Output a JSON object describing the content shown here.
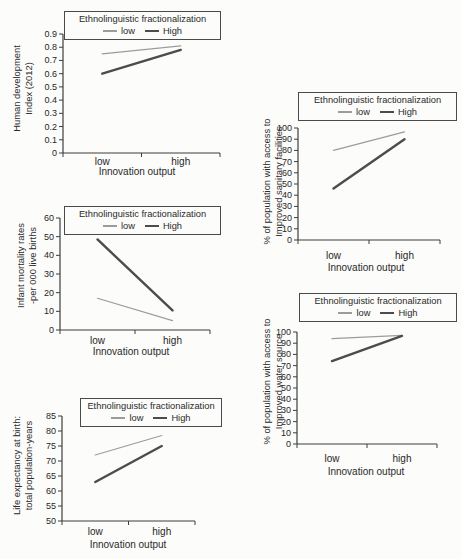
{
  "figure": {
    "legend_title": "Ethnolinguistic fractionalization",
    "legend_entries": [
      "low",
      "High"
    ],
    "xlabel": "Innovation output",
    "x_categories": [
      "low",
      "high"
    ],
    "colors": {
      "background": "#fcfcfa",
      "axis": "#3d3d3d",
      "text": "#262626",
      "legend_border": "#4a4a4a",
      "low_line": "#9c9c9c",
      "high_line": "#4c4c4c"
    }
  },
  "chart_data": [
    {
      "id": "human-development-index",
      "type": "line",
      "title": "",
      "ylabel_lines": [
        "Human development",
        "Index (2012)"
      ],
      "ylabel": "Human development Index (2012)",
      "xlabel": "Innovation output",
      "legend_title": "Ethnolinguistic fractionalization",
      "x": [
        "low",
        "high"
      ],
      "ylim": [
        0,
        0.9
      ],
      "yticks": [
        "0",
        "0.1",
        "0.2",
        "0.3",
        "0.4",
        "0.5",
        "0.6",
        "0.7",
        "0.8",
        "0.9"
      ],
      "series": [
        {
          "name": "low",
          "values": [
            0.75,
            0.81
          ]
        },
        {
          "name": "High",
          "values": [
            0.6,
            0.78
          ]
        }
      ]
    },
    {
      "id": "infant-mortality",
      "type": "line",
      "title": "",
      "ylabel_lines": [
        "Infant mortality rates",
        "-per 000 live births"
      ],
      "ylabel": "Infant mortality rates -per 000 live births",
      "xlabel": "Innovation output",
      "legend_title": "Ethnolinguistic fractionalization",
      "x": [
        "low",
        "high"
      ],
      "ylim": [
        0,
        60
      ],
      "yticks": [
        "0",
        "10",
        "20",
        "30",
        "40",
        "50",
        "60"
      ],
      "series": [
        {
          "name": "low",
          "values": [
            17,
            5
          ]
        },
        {
          "name": "High",
          "values": [
            48.5,
            10.5
          ]
        }
      ]
    },
    {
      "id": "life-expectancy",
      "type": "line",
      "title": "",
      "ylabel_lines": [
        "Life expectancy at birth:",
        "total population-years"
      ],
      "ylabel": "Life expectancy at birth: total population-years",
      "xlabel": "Innovation output",
      "legend_title": "Ethnolinguistic fractionalization",
      "x": [
        "low",
        "high"
      ],
      "ylim": [
        50,
        85
      ],
      "yticks": [
        "50",
        "55",
        "60",
        "65",
        "70",
        "75",
        "80",
        "85"
      ],
      "series": [
        {
          "name": "low",
          "values": [
            72,
            78.5
          ]
        },
        {
          "name": "High",
          "values": [
            63,
            75
          ]
        }
      ]
    },
    {
      "id": "improved-sanitary-facilities",
      "type": "line",
      "title": "",
      "ylabel_lines": [
        "% of population with access to",
        "Improved sanitary facilities"
      ],
      "ylabel": "% of population with access to Improved sanitary facilities",
      "xlabel": "Innovation output",
      "legend_title": "Ethnolinguistic fractionalization",
      "x": [
        "low",
        "high"
      ],
      "ylim": [
        0,
        100
      ],
      "yticks": [
        "0",
        "10",
        "20",
        "30",
        "40",
        "50",
        "60",
        "70",
        "80",
        "90",
        "100"
      ],
      "series": [
        {
          "name": "low",
          "values": [
            80,
            96.5
          ]
        },
        {
          "name": "High",
          "values": [
            46,
            90
          ]
        }
      ]
    },
    {
      "id": "improved-water-source",
      "type": "line",
      "title": "",
      "ylabel_lines": [
        "% of population with access to",
        "Improved water source"
      ],
      "ylabel": "% of population with access to Improved water source",
      "xlabel": "Innovation output",
      "legend_title": "Ethnolinguistic fractionalization",
      "x": [
        "low",
        "high"
      ],
      "ylim": [
        0,
        100
      ],
      "yticks": [
        "0",
        "10",
        "20",
        "30",
        "40",
        "50",
        "60",
        "70",
        "80",
        "90",
        "100"
      ],
      "series": [
        {
          "name": "low",
          "values": [
            94,
            97
          ]
        },
        {
          "name": "High",
          "values": [
            74,
            96.5
          ]
        }
      ]
    }
  ]
}
